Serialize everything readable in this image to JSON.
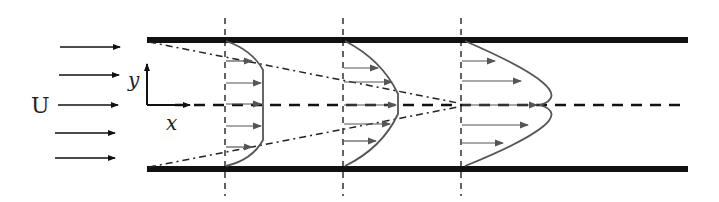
{
  "diagram": {
    "labels": {
      "free_stream": "U",
      "x_axis": "x",
      "y_axis": "y"
    },
    "inlet_arrow_count": 5,
    "stations": [
      {
        "name": "station-1",
        "profile": "flat-core",
        "description": "Boundary layers thin; uniform core velocity",
        "arrow_lengths_rel": [
          0.55,
          0.95,
          0.95,
          0.95,
          0.95,
          0.55
        ]
      },
      {
        "name": "station-2",
        "profile": "partially-developed",
        "description": "Boundary layers thicker; small flat core",
        "arrow_lengths_rel": [
          0.75,
          1.2,
          1.35,
          1.2,
          0.75
        ]
      },
      {
        "name": "station-3",
        "profile": "parabolic",
        "description": "Fully developed parabolic profile",
        "arrow_lengths_rel": [
          0.8,
          1.5,
          1.9,
          1.7,
          1.1
        ]
      }
    ],
    "colors": {
      "wall": "#111111",
      "line": "#222222",
      "profile": "#555555",
      "background": "#ffffff"
    }
  }
}
